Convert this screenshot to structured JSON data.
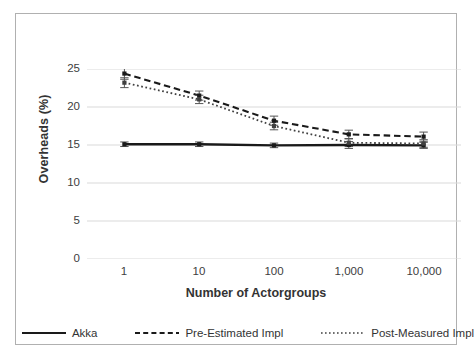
{
  "chart_data": {
    "type": "line",
    "title": "",
    "xlabel": "Number of Actorgroups",
    "ylabel": "Overheads (%)",
    "x": [
      1,
      10,
      100,
      1000,
      10000
    ],
    "categories": [
      "1",
      "10",
      "100",
      "1,000",
      "10,000"
    ],
    "xscale": "category",
    "ylim": [
      0,
      25
    ],
    "yticks": [
      0,
      5,
      10,
      15,
      20,
      25
    ],
    "ytick_labels": [
      "0",
      "5",
      "10",
      "15",
      "20",
      "25"
    ],
    "grid": "horizontal",
    "legend_position": "bottom",
    "error_bars": true,
    "series": [
      {
        "name": "Akka",
        "style": "solid",
        "color": "#1a1a1a",
        "values": [
          15.1,
          15.1,
          14.95,
          15.0,
          14.95
        ],
        "errors": [
          0.3,
          0.3,
          0.3,
          0.45,
          0.4
        ]
      },
      {
        "name": "Pre-Estimated Impl",
        "style": "dashed",
        "color": "#1a1a1a",
        "values": [
          24.4,
          21.5,
          18.2,
          16.4,
          16.1
        ],
        "errors": [
          0.75,
          0.6,
          0.6,
          0.55,
          0.6
        ]
      },
      {
        "name": "Post-Measured Impl",
        "style": "dotted",
        "color": "#404040",
        "values": [
          23.2,
          21.0,
          17.5,
          15.3,
          15.2
        ],
        "errors": [
          0.65,
          0.55,
          0.5,
          0.5,
          0.5
        ]
      }
    ]
  },
  "axes": {
    "y_title": "Overheads (%)",
    "x_title": "Number of Actorgroups",
    "y_tick_labels": [
      "25",
      "20",
      "15",
      "10",
      "5",
      "0"
    ],
    "x_tick_labels": [
      "1",
      "10",
      "100",
      "1,000",
      "10,000"
    ]
  },
  "legend": {
    "items": [
      {
        "label": "Akka",
        "style": "solid"
      },
      {
        "label": "Pre-Estimated Impl",
        "style": "dashed"
      },
      {
        "label": "Post-Measured Impl",
        "style": "dotted"
      }
    ]
  },
  "colors": {
    "frame": "#b0b0b0",
    "grid": "#d9d9d9",
    "series_dark": "#1a1a1a",
    "series_mid": "#404040",
    "text": "#333333",
    "background": "#ffffff"
  }
}
